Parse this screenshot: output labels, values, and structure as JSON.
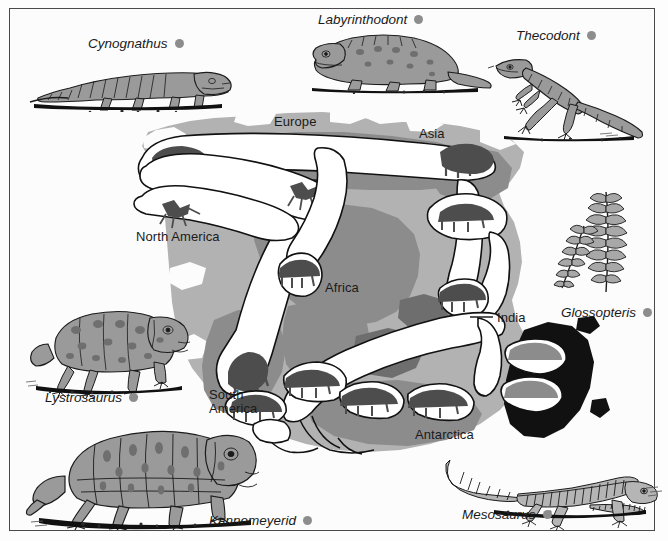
{
  "figure": {
    "frame_color": "#4a4a4a",
    "background_color": "#fcfcfc"
  },
  "palette": {
    "land_light_gray": "#b2b2b2",
    "land_mid_gray": "#8c8c8c",
    "land_dark_gray": "#6e6e6e",
    "land_black": "#111111",
    "fossil_band_fill": "#ffffff",
    "fossil_band_stroke": "#111111",
    "fossil_silhouette": "#4d4d4d",
    "key_dot": "#8d8d8d",
    "text": "#1a1a1a"
  },
  "continent_labels": [
    {
      "id": "europe",
      "text": "Europe",
      "x": 274,
      "y": 121
    },
    {
      "id": "asia",
      "text": "Asia",
      "x": 419,
      "y": 132
    },
    {
      "id": "north-america",
      "text": "North America",
      "x": 136,
      "y": 231
    },
    {
      "id": "africa",
      "text": "Africa",
      "x": 325,
      "y": 282
    },
    {
      "id": "india",
      "text": "India",
      "x": 500,
      "y": 314
    },
    {
      "id": "south-america",
      "text": "South America",
      "line1": "South",
      "line2": "America",
      "x": 209,
      "y": 392
    },
    {
      "id": "antarctica",
      "text": "Antarctica",
      "x": 415,
      "y": 428
    }
  ],
  "fossil_key": [
    {
      "id": "cynognathus",
      "name": "Cynognathus",
      "x": 88,
      "y": 36,
      "dot": true
    },
    {
      "id": "labyrinthodont",
      "name": "Labyrinthodont",
      "x": 318,
      "y": 12,
      "dot": true
    },
    {
      "id": "thecodont",
      "name": "Thecodont",
      "x": 516,
      "y": 28,
      "dot": true
    },
    {
      "id": "glossopteris",
      "name": "Glossopteris",
      "x": 563,
      "y": 305,
      "dot": true
    },
    {
      "id": "lystrosaurus",
      "name": "Lystrosaurus",
      "x": 45,
      "y": 390,
      "dot": true
    },
    {
      "id": "kannemeyerid",
      "name": "Kannemeyerid",
      "x": 209,
      "y": 514,
      "dot": true
    },
    {
      "id": "mesosaurus",
      "name": "Mesosaurus",
      "x": 463,
      "y": 508,
      "dot": true
    }
  ],
  "organisms": [
    {
      "id": "cynognathus-drawing",
      "label": "Cynognathus",
      "kind": "cynodont-reptile-side-view"
    },
    {
      "id": "labyrinthodont-drawing",
      "label": "Labyrinthodont",
      "kind": "amphibian-side-view"
    },
    {
      "id": "thecodont-drawing",
      "label": "Thecodont",
      "kind": "bipedal-archosaur-side-view"
    },
    {
      "id": "glossopteris-drawing",
      "label": "Glossopteris",
      "kind": "fern-frond-plant"
    },
    {
      "id": "lystrosaurus-drawing",
      "label": "Lystrosaurus",
      "kind": "dicynodont-quadruped"
    },
    {
      "id": "kannemeyerid-drawing",
      "label": "Kannemeyerid",
      "kind": "dicynodont-quadruped-large"
    },
    {
      "id": "mesosaurus-drawing",
      "label": "Mesosaurus",
      "kind": "aquatic-reptile-skeleton"
    }
  ],
  "india_leader_line": {
    "from_x": 491,
    "from_y": 317,
    "to_x": 470,
    "to_y": 317
  }
}
